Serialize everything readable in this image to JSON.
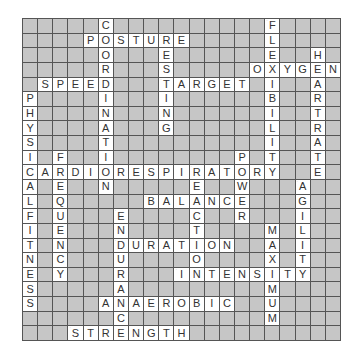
{
  "puzzle": {
    "cols": 21,
    "rows": 22,
    "colors": {
      "block": "#c6c6c6",
      "open": "#ffffff",
      "line": "#555555",
      "letter": "#333333"
    },
    "words": [
      {
        "word": "COORDINATION",
        "row": 0,
        "col": 5,
        "dir": "down"
      },
      {
        "word": "FLEXIBILITY",
        "row": 0,
        "col": 16,
        "dir": "down"
      },
      {
        "word": "POSTURE",
        "row": 1,
        "col": 4,
        "dir": "across"
      },
      {
        "word": "RESTING",
        "row": 1,
        "col": 9,
        "dir": "down"
      },
      {
        "word": "HEARTRATE",
        "row": 2,
        "col": 19,
        "dir": "down"
      },
      {
        "word": "OXYGEN",
        "row": 3,
        "col": 15,
        "dir": "across"
      },
      {
        "word": "SPEED",
        "row": 4,
        "col": 1,
        "dir": "across"
      },
      {
        "word": "TARGET",
        "row": 4,
        "col": 9,
        "dir": "across"
      },
      {
        "word": "PHYSICALFITNESS",
        "row": 5,
        "col": 0,
        "dir": "down"
      },
      {
        "word": "FREQUENCY",
        "row": 9,
        "col": 2,
        "dir": "down"
      },
      {
        "word": "POWER",
        "row": 9,
        "col": 14,
        "dir": "down"
      },
      {
        "word": "CARDIORESPIRATORY",
        "row": 10,
        "col": 0,
        "dir": "across"
      },
      {
        "word": "REACTION",
        "row": 10,
        "col": 11,
        "dir": "down"
      },
      {
        "word": "AGILITY",
        "row": 11,
        "col": 18,
        "dir": "down"
      },
      {
        "word": "BALANCE",
        "row": 12,
        "col": 8,
        "dir": "across"
      },
      {
        "word": "ENDURANCE",
        "row": 13,
        "col": 6,
        "dir": "down"
      },
      {
        "word": "MAXIMUM",
        "row": 14,
        "col": 16,
        "dir": "down"
      },
      {
        "word": "DURATION",
        "row": 15,
        "col": 6,
        "dir": "across"
      },
      {
        "word": "INTENSITY",
        "row": 17,
        "col": 10,
        "dir": "across"
      },
      {
        "word": "ANAEROBIC",
        "row": 19,
        "col": 5,
        "dir": "across"
      },
      {
        "word": "STRENGTH",
        "row": 21,
        "col": 3,
        "dir": "across"
      }
    ]
  }
}
